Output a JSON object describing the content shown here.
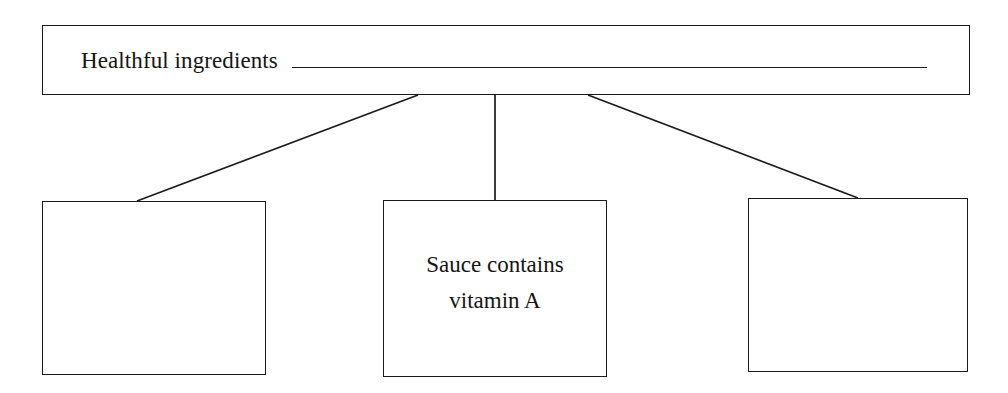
{
  "diagram": {
    "type": "graphic-organizer",
    "layout": "one-header-three-details",
    "header": {
      "label": "Healthful ingredients",
      "has_fill_in_blank_rule": true,
      "blank_value": ""
    },
    "details": [
      {
        "id": "detail-1",
        "text": "",
        "filled": false
      },
      {
        "id": "detail-2",
        "text": "Sauce contains vitamin A",
        "line1": "Sauce contains",
        "line2": "vitamin A",
        "filled": true
      },
      {
        "id": "detail-3",
        "text": "",
        "filled": false
      }
    ],
    "connectors": [
      {
        "from": "header",
        "to": "detail-1",
        "style": "diagonal"
      },
      {
        "from": "header",
        "to": "detail-2",
        "style": "vertical"
      },
      {
        "from": "header",
        "to": "detail-3",
        "style": "diagonal"
      }
    ],
    "colors": {
      "stroke": "#1a1a1a",
      "text": "#141414",
      "background": "#ffffff"
    }
  }
}
